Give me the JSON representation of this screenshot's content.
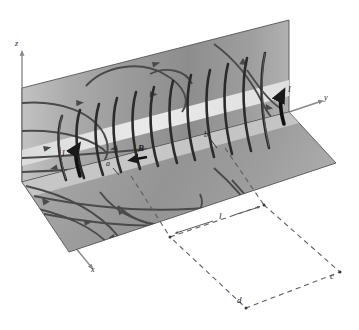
{
  "figure": {
    "kind": "physics-diagram",
    "axes": {
      "z_label": "z",
      "y_label": "y",
      "x_label": "x"
    },
    "labels": {
      "current_left": "I",
      "current_right": "I",
      "field_vector": "B",
      "coil_point_a": "a",
      "coil_point_b": "b",
      "length_l": "l",
      "corner_c": "c",
      "corner_d": "d"
    },
    "colors": {
      "plane_vertical_light": "#b9b9b9",
      "plane_vertical_dark": "#8f8f8f",
      "plane_horizontal_light": "#a8a8a8",
      "plane_horizontal_dark": "#8a8a8a",
      "band_highlight": "#e8e8e8",
      "field_line": "#4a4a4a",
      "coil_wire": "#2b2b2b",
      "axis": "#8a8a8a",
      "ink": "#1a1a1a",
      "dashed": "#6f6f6f"
    }
  }
}
